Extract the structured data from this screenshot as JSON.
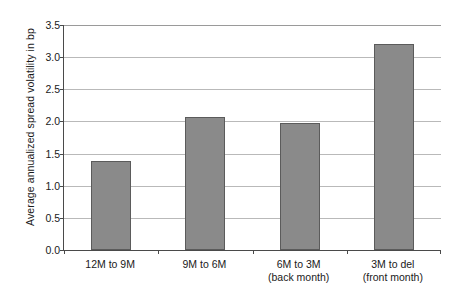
{
  "chart_data": {
    "type": "bar",
    "title": "",
    "subtitle": "",
    "xlabel": "",
    "ylabel": "Average annualized spread volatility in bp",
    "categories": [
      "12M to 9M",
      "9M to 6M",
      "6M to 3M",
      "3M to del"
    ],
    "category_sublabels": [
      "",
      "",
      "(back month)",
      "(front month)"
    ],
    "values": [
      1.38,
      2.07,
      1.98,
      3.2
    ],
    "ylim": [
      0.0,
      3.5
    ],
    "ytick_labels": [
      "0.0",
      "0.5",
      "1.0",
      "1.5",
      "2.0",
      "2.5",
      "3.0",
      "3.5"
    ],
    "ytick_values": [
      0.0,
      0.5,
      1.0,
      1.5,
      2.0,
      2.5,
      3.0,
      3.5
    ],
    "grid": true,
    "grid_axis": "y",
    "legend": false,
    "legend_position": "none",
    "colors": {
      "bar_fill": "#8a8a8a",
      "bar_edge": "#5b5b5b",
      "gridline": "#b9b9b9",
      "axis": "#4a4a4a",
      "background": "#ffffff",
      "text": "#1a1a1a"
    }
  }
}
